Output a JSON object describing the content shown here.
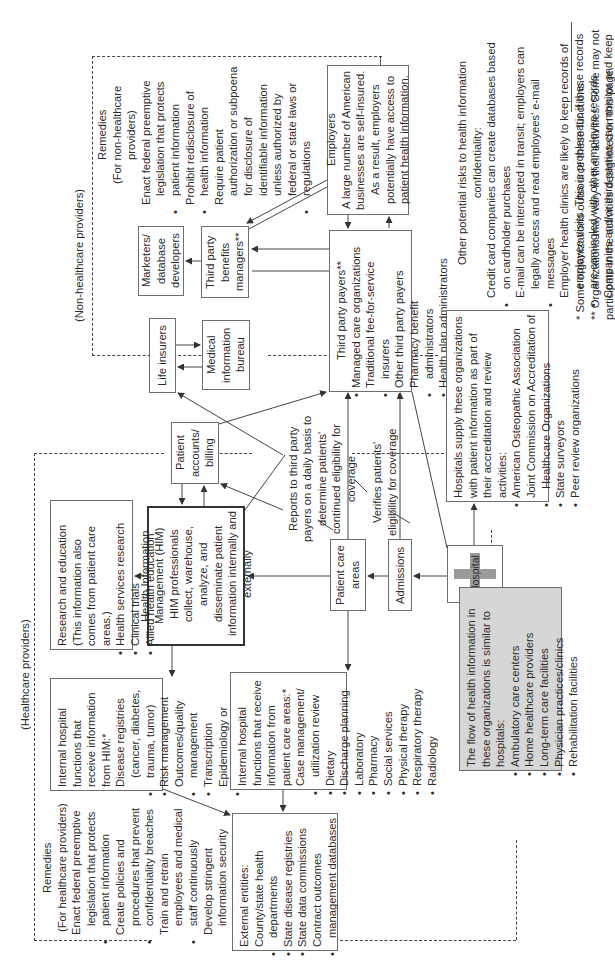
{
  "regions": {
    "non_healthcare_label": "(Non-healthcare providers)",
    "healthcare_label": "(Healthcare providers)"
  },
  "remedies_non_healthcare": {
    "title": "Remedies",
    "subtitle": "(For non-healthcare providers)",
    "items": [
      "Enact federal preemptive legislation that protects patient information",
      "Prohibit redisclosure of health information",
      "Require patient authorization or subpoena for disclosure of identifiable information unless authorized by federal or state laws or regulations"
    ]
  },
  "remedies_healthcare": {
    "title": "Remedies",
    "subtitle": "(For healthcare providers)",
    "items": [
      "Enact federal preemptive legislation that protects patient information",
      "Create policies and procedures that prevent confidentiality breaches",
      "Train and retrain employees and medical staff continuously",
      "Develop stringent information security programs"
    ]
  },
  "nodes": {
    "marketers": "Marketers/ database developers",
    "third_party_benefits": "Third party benefits managers**",
    "life_insurers": "Life insurers",
    "mib": "Medical information bureau",
    "employers": {
      "title": "Employers",
      "text": "A large number of American businesses are self-insured. As a result, employers potentially have access to patient health information."
    },
    "third_party_payers": {
      "title": "Third party payers**",
      "items": [
        "Managed care organizations",
        "Traditional fee-for-service insurers",
        "Other third party payers",
        "Pharmacy benefit administrators",
        "Health plan administrators"
      ]
    },
    "patient_accounts": "Patient accounts/ billing",
    "him": {
      "title": "Health Information Management (HIM)",
      "text": "HIM professionals collect, warehouse, analyze, and disseminate patient information internally and externally"
    },
    "research": {
      "title": "Research and education",
      "subtitle": "(This information also comes from patient care areas.)",
      "items": [
        "Health services research",
        "Clinical trials",
        "Allied health education"
      ]
    },
    "internal_him": {
      "title": "Internal hospital functions that receive information from HIM:*",
      "items": [
        "Disease registries (cancer, diabetes, trauma, tumor)",
        "Risk management",
        "Outcomes/quality management",
        "Transcription",
        "Epidemiology or infection control"
      ]
    },
    "internal_pca": {
      "title": "Internal hospital functions that receive information from patient care areas:*",
      "items": [
        "Case management/ utilization review",
        "Dietary",
        "Discharge planning",
        "Laboratory",
        "Pharmacy",
        "Social services",
        "Physical therapy",
        "Respiratory therapy",
        "Radiology"
      ]
    },
    "external": {
      "title": "External entities:",
      "items": [
        "County/state health departments",
        "State disease registries",
        "State data commissions",
        "Contract outcomes management databases"
      ]
    },
    "patient_care_areas": "Patient care areas",
    "admissions": "Admissions",
    "hospital": "Hospital",
    "accreditation": {
      "title": "Hospitals supply these organizations with patient information as part of their accreditation and review activities:",
      "items": [
        "American Osteopathic Association",
        "Joint Commission on Accreditation of Healthcare Organizations",
        "State surveyors",
        "Peer review organizations"
      ]
    },
    "similar_orgs": {
      "title": "The flow of health information in these organizations is similar to hospitals:",
      "items": [
        "Ambulatory care centers",
        "Home healthcare providers",
        "Long-term care facilities",
        "Physician practices/clinics",
        "Rehabilitation facilities"
      ]
    }
  },
  "annotations": {
    "reports": "Reports to third party payers on a daily basis to determine patients' continued eligibility for coverage",
    "verifies": "Verifies patients' eligibility for coverage"
  },
  "other_risks": {
    "title": "Other potential risks to health information confidentiality:",
    "items": [
      "Credit card companies can create databases based on cardholder purchases",
      "E-mail can be intercepted in transit; employers can legally access and read employees' e-mail messages",
      "Employer health clinics are likely to keep records of employee visits. This is problematic if these records are comingled with other employee records",
      "Companies and/or third parties can monitor and keep records of the e-mail addresses of visitors to Internet chat rooms and Web sites"
    ]
  },
  "footnotes": {
    "single": "* Some organizations outsource these functions.",
    "double": "** Organizations may vary in their activities. Some may not participate in the activities designated on this page."
  },
  "colors": {
    "line": "#444444",
    "box_border": "#6e6e6e",
    "gray_fill": "#d6d6d6",
    "cross": "#9a9a9a"
  }
}
